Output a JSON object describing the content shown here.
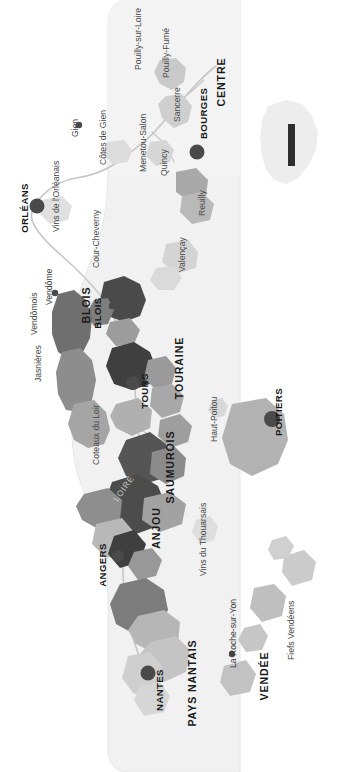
{
  "map": {
    "title": "Loire Valley Wine Regions",
    "orientation": "rotated-90",
    "background_color": "#ffffff",
    "bottle_fill": "#f1f1f1",
    "bottle_stroke": "#e3e3e3",
    "river_label": "LOIRE",
    "colors": {
      "very_dark": "#3d3d3d",
      "dark": "#5f5f5f",
      "medium": "#8a8a8a",
      "light": "#b4b4b4",
      "pale": "#d2d2d2",
      "very_pale": "#e2e2e2",
      "city_dot": "#4a4a4a",
      "inset_highlight": "#2b2b2b",
      "inset_fill": "#ececec"
    },
    "areas": [
      {
        "name": "PAYS NANTAIS",
        "x": 196,
        "y": 683
      },
      {
        "name": "ANJOU",
        "x": 160,
        "y": 528
      },
      {
        "name": "SAUMUROIS",
        "x": 174,
        "y": 467
      },
      {
        "name": "TOURAINE",
        "x": 183,
        "y": 368
      },
      {
        "name": "BLOIS",
        "x": 90,
        "y": 305
      },
      {
        "name": "VENDÉE",
        "x": 268,
        "y": 676
      },
      {
        "name": "CENTRE",
        "x": 225,
        "y": 82
      }
    ],
    "cities": [
      {
        "name": "NANTES",
        "x": 148,
        "y": 673,
        "dot": true,
        "major": true
      },
      {
        "name": "ANGERS",
        "x": 100,
        "y": 558,
        "dot": true,
        "major": true
      },
      {
        "name": "TOURS",
        "x": 133,
        "y": 383,
        "dot": true,
        "major": true
      },
      {
        "name": "BLOIS",
        "x": 112,
        "y": 313,
        "dot": true,
        "major": false
      },
      {
        "name": "ORLÉANS",
        "x": 33,
        "y": 206,
        "dot": true,
        "major": true
      },
      {
        "name": "BOURGES",
        "x": 204,
        "y": 152,
        "dot": true,
        "major": true
      },
      {
        "name": "POITIERS",
        "x": 276,
        "y": 420,
        "dot": true,
        "major": true
      },
      {
        "name": "Gien",
        "x": 82,
        "y": 131,
        "dot": true,
        "major": false
      },
      {
        "name": "Vendôme",
        "x": 62,
        "y": 287,
        "dot": true,
        "major": false
      },
      {
        "name": "La Roche-sur-Yon",
        "x": 250,
        "y": 655,
        "dot": true,
        "major": false
      }
    ],
    "appellations": [
      {
        "name": "Pouilly-sur-Loire",
        "x": 141,
        "y": 62
      },
      {
        "name": "Pouilly-Fumé",
        "x": 172,
        "y": 68
      },
      {
        "name": "Sancerre",
        "x": 182,
        "y": 115
      },
      {
        "name": "Menetou-Salon",
        "x": 148,
        "y": 160
      },
      {
        "name": "Quincy",
        "x": 168,
        "y": 168
      },
      {
        "name": "Reuilly",
        "x": 205,
        "y": 205
      },
      {
        "name": "Côtes de Gien",
        "x": 108,
        "y": 152
      },
      {
        "name": "Vins de l'Orléanais",
        "x": 59,
        "y": 212
      },
      {
        "name": "Valençay",
        "x": 187,
        "y": 258
      },
      {
        "name": "Cour-Cheverny",
        "x": 101,
        "y": 242
      },
      {
        "name": "Vendômois",
        "x": 39,
        "y": 317
      },
      {
        "name": "Jasnières",
        "x": 43,
        "y": 366
      },
      {
        "name": "Coteaux du Loir",
        "x": 101,
        "y": 437
      },
      {
        "name": "Haut-Poitou",
        "x": 219,
        "y": 420
      },
      {
        "name": "Vins du Thouarsais",
        "x": 208,
        "y": 540
      },
      {
        "name": "Fiefs Vendéens",
        "x": 296,
        "y": 629
      }
    ],
    "inset": {
      "label": "France",
      "highlight_label": "Loire"
    }
  }
}
